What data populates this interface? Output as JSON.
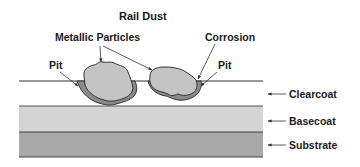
{
  "title": "Rail Dust",
  "labels": {
    "metallic_particles": "Metallic Particles",
    "corrosion": "Corrosion",
    "pit_left": "Pit",
    "pit_right": "Pit"
  },
  "layers": [
    {
      "name": "Clearcoat",
      "color": "#ffffff"
    },
    {
      "name": "Basecoat",
      "color": "#d4d4d4"
    },
    {
      "name": "Substrate",
      "color": "#a8a8a8"
    }
  ],
  "colors": {
    "particle_fill": "#c4c4c4",
    "corrosion_fill": "#8a8a8a",
    "outline": "#333333",
    "text": "#1a1a1a"
  }
}
